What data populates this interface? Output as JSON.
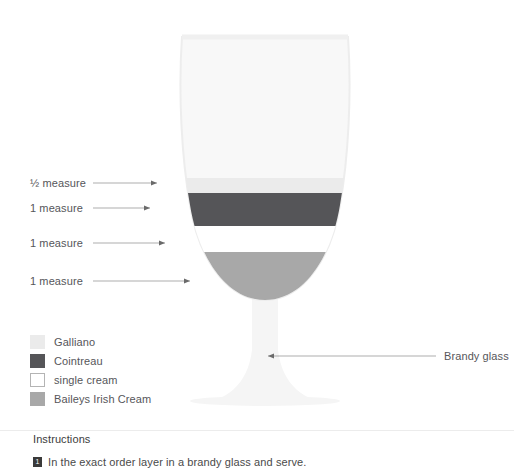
{
  "diagram": {
    "title_subject": "Brandy glass cocktail layers",
    "glass": {
      "colors": {
        "glass_body": "#f7f7f7",
        "glass_outline": "#ededed",
        "stem": "#f5f5f5"
      }
    },
    "layers": [
      {
        "id": "galliano",
        "measure": "½ measure",
        "ingredient": "Galliano",
        "color": "#ebebeb",
        "label_y": 178,
        "leader_end_x": 157,
        "leader_y": 183
      },
      {
        "id": "cointreau",
        "measure": "1 measure",
        "ingredient": "Cointreau",
        "color": "#555558",
        "label_y": 203,
        "leader_end_x": 150,
        "leader_y": 208
      },
      {
        "id": "single-cream",
        "measure": "1 measure",
        "ingredient": "single cream",
        "color": "#ffffff",
        "label_y": 238,
        "leader_end_x": 165,
        "leader_y": 243
      },
      {
        "id": "baileys",
        "measure": "1 measure",
        "ingredient": "Baileys Irish Cream",
        "color": "#a8a8a8",
        "label_y": 276,
        "leader_end_x": 190,
        "leader_y": 281
      }
    ],
    "legend": [
      {
        "label": "Galliano",
        "color": "#ebebeb",
        "border": "#ebebeb"
      },
      {
        "label": "Cointreau",
        "color": "#555558",
        "border": "#555558"
      },
      {
        "label": "single cream",
        "color": "#ffffff",
        "border": "#b4b4b4"
      },
      {
        "label": "Baileys Irish Cream",
        "color": "#a8a8a8",
        "border": "#a8a8a8"
      }
    ],
    "glass_callout": {
      "label": "Brandy glass",
      "label_x": 444,
      "label_y": 350,
      "leader_from_x": 436,
      "leader_to_x": 268,
      "leader_y": 356
    }
  },
  "instructions": {
    "heading": "Instructions",
    "steps": [
      {
        "number": "1",
        "text": "In the exact order layer in a brandy glass and serve."
      }
    ]
  }
}
